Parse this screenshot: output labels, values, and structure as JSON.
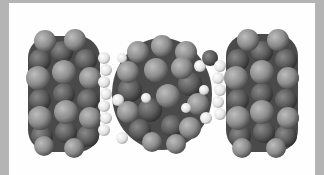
{
  "image": {
    "subject": "space-filling molecular model, dumbbell-shaped assembly",
    "colors": {
      "frame": "#b4b4b4",
      "background": "#fefefe",
      "atom_dark": "#555555",
      "atom_mid": "#8a8a8a",
      "atom_light": "#e8e8e8"
    }
  }
}
